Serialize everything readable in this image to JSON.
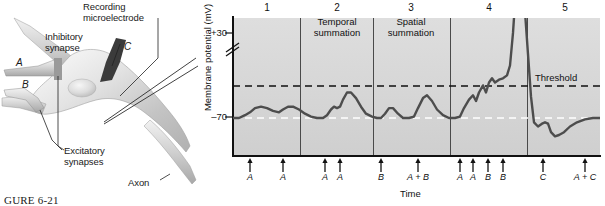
{
  "figure": {
    "caption": "GURE 6-21"
  },
  "diagram": {
    "labels": [
      {
        "name": "inhibitory-synapse-label",
        "text": "Inhibitory\nsynapse",
        "x": 72,
        "y": 32,
        "italic": false
      },
      {
        "name": "recording-microelectrode-label",
        "text": "Recording\nmicroelectrode",
        "x": 83,
        "y": 2,
        "italic": false
      },
      {
        "name": "excitatory-synapses-label",
        "text": "Excitatory\nsynapses",
        "x": 60,
        "y": 147,
        "italic": false
      },
      {
        "name": "axon-label",
        "text": "Axon",
        "x": 130,
        "y": 178,
        "italic": false
      },
      {
        "name": "input-a-label",
        "text": "A",
        "x": 16,
        "y": 64,
        "italic": true
      },
      {
        "name": "input-b-label",
        "text": "B",
        "x": 20,
        "y": 88,
        "italic": true
      },
      {
        "name": "input-c-label",
        "text": "C",
        "x": 125,
        "y": 44,
        "italic": true
      }
    ]
  },
  "chart_data": {
    "type": "line",
    "title": "",
    "ylabel": "Membrane potential (mV)",
    "xlabel": "Time",
    "yticks": [
      "+30",
      "–70"
    ],
    "ylim": [
      -90,
      40
    ],
    "axis_break": true,
    "grid": false,
    "baseline_label": "–70",
    "threshold_label": "Threshold",
    "panels": [
      {
        "number": "1",
        "title": "",
        "stimuli": [
          "A",
          "A"
        ]
      },
      {
        "number": "2",
        "title": "Temporal\nsummation",
        "stimuli": [
          "A",
          "A"
        ]
      },
      {
        "number": "3",
        "title": "Spatial\nsummation",
        "stimuli": [
          "B",
          "A + B"
        ]
      },
      {
        "number": "4",
        "title": "",
        "stimuli": [
          "A",
          "A",
          "B",
          "B"
        ]
      },
      {
        "number": "5",
        "title": "",
        "stimuli": [
          "C",
          "A + C"
        ]
      }
    ],
    "stimulus_marks": [
      {
        "label": "A",
        "x": 17
      },
      {
        "label": "A",
        "x": 50
      },
      {
        "label": "A",
        "x": 92
      },
      {
        "label": "A",
        "x": 107
      },
      {
        "label": "B",
        "x": 148
      },
      {
        "label": "A + B",
        "x": 185
      },
      {
        "label": "A",
        "x": 227
      },
      {
        "label": "A",
        "x": 240
      },
      {
        "label": "B",
        "x": 255
      },
      {
        "label": "B",
        "x": 270
      },
      {
        "label": "C",
        "x": 310
      },
      {
        "label": "A + C",
        "x": 352
      }
    ],
    "series": [
      {
        "name": "Membrane potential",
        "color": "#4d4d4d",
        "points": [
          [
            0,
            -70
          ],
          [
            6,
            -70
          ],
          [
            12,
            -68
          ],
          [
            17,
            -66
          ],
          [
            22,
            -63
          ],
          [
            28,
            -62
          ],
          [
            34,
            -63
          ],
          [
            40,
            -65
          ],
          [
            46,
            -66
          ],
          [
            50,
            -64
          ],
          [
            55,
            -62
          ],
          [
            60,
            -62
          ],
          [
            66,
            -64
          ],
          [
            72,
            -67
          ],
          [
            78,
            -69
          ],
          [
            84,
            -70
          ],
          [
            90,
            -70
          ],
          [
            94,
            -68
          ],
          [
            98,
            -64
          ],
          [
            101,
            -62
          ],
          [
            104,
            -63
          ],
          [
            107,
            -62
          ],
          [
            110,
            -57
          ],
          [
            114,
            -52
          ],
          [
            118,
            -52
          ],
          [
            123,
            -56
          ],
          [
            128,
            -62
          ],
          [
            133,
            -67
          ],
          [
            139,
            -69
          ],
          [
            144,
            -70
          ],
          [
            148,
            -70
          ],
          [
            152,
            -67
          ],
          [
            156,
            -63
          ],
          [
            160,
            -63
          ],
          [
            165,
            -67
          ],
          [
            170,
            -70
          ],
          [
            176,
            -70
          ],
          [
            181,
            -69
          ],
          [
            185,
            -63
          ],
          [
            190,
            -56
          ],
          [
            194,
            -54
          ],
          [
            199,
            -58
          ],
          [
            204,
            -64
          ],
          [
            210,
            -68
          ],
          [
            216,
            -70
          ],
          [
            222,
            -70
          ],
          [
            227,
            -69
          ],
          [
            231,
            -63
          ],
          [
            236,
            -57
          ],
          [
            240,
            -54
          ],
          [
            243,
            -58
          ],
          [
            246,
            -52
          ],
          [
            250,
            -47
          ],
          [
            253,
            -52
          ],
          [
            256,
            -45
          ],
          [
            259,
            -42
          ],
          [
            262,
            -45
          ],
          [
            266,
            -43
          ],
          [
            270,
            -42
          ],
          [
            274,
            -40
          ],
          [
            277,
            -33
          ],
          [
            280,
            -10
          ],
          [
            283,
            22
          ],
          [
            286,
            33
          ],
          [
            289,
            28
          ],
          [
            292,
            5
          ],
          [
            295,
            -25
          ],
          [
            298,
            -55
          ],
          [
            301,
            -73
          ],
          [
            305,
            -76
          ],
          [
            309,
            -74
          ],
          [
            312,
            -73
          ],
          [
            315,
            -74
          ],
          [
            318,
            -80
          ],
          [
            322,
            -83
          ],
          [
            326,
            -82
          ],
          [
            331,
            -80
          ],
          [
            337,
            -76
          ],
          [
            344,
            -73
          ],
          [
            352,
            -71
          ],
          [
            360,
            -70
          ],
          [
            367,
            -70
          ]
        ]
      }
    ]
  }
}
